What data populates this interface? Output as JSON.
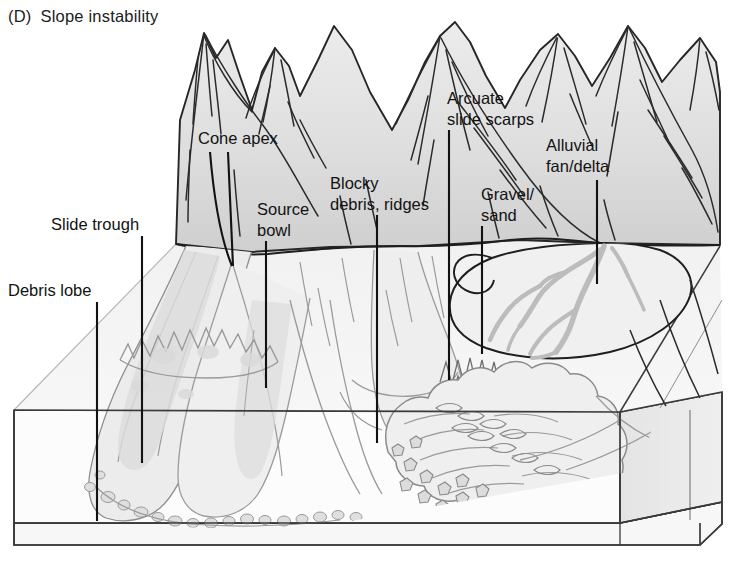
{
  "figure": {
    "panel_id": "(D)",
    "title": "Slope instability",
    "type": "annotated-block-diagram"
  },
  "labels": [
    {
      "id": "cone-apex",
      "text": "Cone apex",
      "text_x": 198,
      "text_y": 144,
      "anchor": "start",
      "leader": {
        "kind": "double-curve",
        "x1": 218,
        "y1": 150,
        "x2": 233,
        "y2": 265
      }
    },
    {
      "id": "arcuate-slide-scarps",
      "text_lines": [
        "Arcuate",
        "slide scarps"
      ],
      "text_x": 447,
      "text_y": 104,
      "anchor": "start",
      "leader": {
        "kind": "straight",
        "x1": 449,
        "y1": 130,
        "x2": 449,
        "y2": 380
      }
    },
    {
      "id": "alluvial-fan-delta",
      "text_lines": [
        "Alluvial",
        "fan/delta"
      ],
      "text_x": 546,
      "text_y": 151,
      "anchor": "start",
      "leader": {
        "kind": "straight",
        "x1": 597,
        "y1": 180,
        "x2": 597,
        "y2": 284
      }
    },
    {
      "id": "blocky-debris-ridges",
      "text_lines": [
        "Blocky",
        "debris, ridges"
      ],
      "text_x": 330,
      "text_y": 189,
      "anchor": "start",
      "leader": {
        "kind": "straight",
        "x1": 377,
        "y1": 215,
        "x2": 377,
        "y2": 443
      }
    },
    {
      "id": "gravel-sand",
      "text_lines": [
        "Gravel/",
        "sand"
      ],
      "text_x": 481,
      "text_y": 200,
      "anchor": "start",
      "leader": {
        "kind": "straight",
        "x1": 482,
        "y1": 226,
        "x2": 482,
        "y2": 354
      }
    },
    {
      "id": "slide-trough",
      "text": "Slide trough",
      "text_x": 51,
      "text_y": 230,
      "anchor": "start",
      "leader": {
        "kind": "straight",
        "x1": 142,
        "y1": 236,
        "x2": 142,
        "y2": 463
      }
    },
    {
      "id": "source-bowl",
      "text_lines": [
        "Source",
        "bowl"
      ],
      "text_x": 257,
      "text_y": 215,
      "anchor": "start",
      "leader": {
        "kind": "straight",
        "x1": 266,
        "y1": 241,
        "x2": 266,
        "y2": 388
      }
    },
    {
      "id": "debris-lobe",
      "text": "Debris lobe",
      "text_x": 8,
      "text_y": 296,
      "anchor": "start",
      "leader": {
        "kind": "straight",
        "x1": 97,
        "y1": 302,
        "x2": 97,
        "y2": 521
      }
    }
  ],
  "colors": {
    "ink": "#1b1b1b",
    "line": "#333333",
    "soft_line": "#8d8d8d",
    "mountain_fill": "#e2e2e2",
    "mountain_fill_dark": "#d2d2d2",
    "valley_fill": "#f3f3f3",
    "front_face_fill": "#fbfbfb",
    "side_face_fill": "#eaeaea",
    "base_slab_fill": "#f7f7f7",
    "stream_gray": "#b9b9b9",
    "debris_fill": "#ededed",
    "clast_fill": "#dcdcdc",
    "background": "#ffffff"
  },
  "features": {
    "mountain_peaks": 6,
    "drainage_cones": 3,
    "braided_channels": "gravel/sand streams on the alluvial fan",
    "blocky_debris_lobe": "large lobate rock-avalanche deposit on valley floor",
    "block_base": "cut-away cross-section slab at base"
  }
}
